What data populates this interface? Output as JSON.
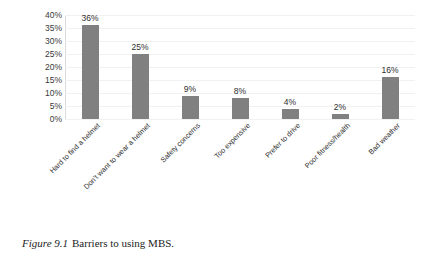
{
  "chart_data": {
    "type": "bar",
    "title": "",
    "xlabel": "",
    "ylabel": "",
    "categories": [
      "Hard to find a helmet",
      "Don't want to wear a helmet",
      "Safety concerns",
      "Too expensive",
      "Prefer to drive",
      "Poor fitness/health",
      "Bad weather"
    ],
    "values": [
      36,
      25,
      9,
      8,
      4,
      2,
      16
    ],
    "value_labels": [
      "36%",
      "25%",
      "9%",
      "8%",
      "4%",
      "2%",
      "16%"
    ],
    "ylim": [
      0,
      40
    ],
    "ytick_values": [
      0,
      5,
      10,
      15,
      20,
      25,
      30,
      35,
      40
    ],
    "ytick_labels": [
      "0%",
      "5%",
      "10%",
      "15%",
      "20%",
      "25%",
      "30%",
      "35%",
      "40%"
    ],
    "grid": "horizontal",
    "legend": "none",
    "bar_color": "#808080",
    "gridline_color": "#f1f1f1",
    "axis_color": "#cfcfcf",
    "text_color": "#2e2e2e"
  },
  "caption": {
    "figure_number": "Figure 9.1",
    "text": "Barriers to using MBS."
  }
}
